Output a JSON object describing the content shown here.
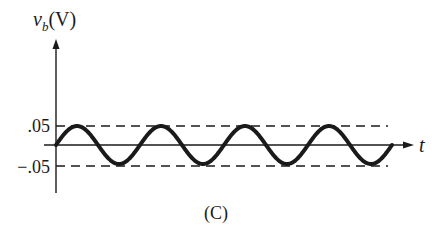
{
  "chart_data": {
    "type": "line",
    "title": "",
    "caption": "(C)",
    "xlabel": "t",
    "ylabel_var": "v",
    "ylabel_sub": "b",
    "ylabel_unit": "(V)",
    "yticks": [
      {
        "value": 0.05,
        "label": ".05"
      },
      {
        "value": -0.05,
        "label": "−.05"
      }
    ],
    "reference_lines": [
      {
        "value": 0.05,
        "style": "dashed"
      },
      {
        "value": -0.05,
        "style": "dashed"
      }
    ],
    "series": [
      {
        "name": "v_b(t)",
        "function": "sine",
        "amplitude": 0.05,
        "cycles": 4,
        "phase": 0
      }
    ],
    "ylim": [
      -0.05,
      0.05
    ],
    "grid": false,
    "legend": null
  },
  "colors": {
    "ink": "#1a1a1a",
    "background": "#ffffff"
  }
}
